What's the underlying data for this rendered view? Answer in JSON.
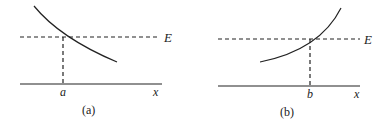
{
  "panels": [
    {
      "id": "a",
      "caption": "(a)",
      "energy_label": "E",
      "axis_label": "x",
      "intersection_label": "a",
      "curve": "decreasing"
    },
    {
      "id": "b",
      "caption": "(b)",
      "energy_label": "E",
      "axis_label": "x",
      "intersection_label": "b",
      "curve": "increasing"
    }
  ],
  "colors": {
    "stroke": "#222222",
    "background": "#ffffff"
  }
}
